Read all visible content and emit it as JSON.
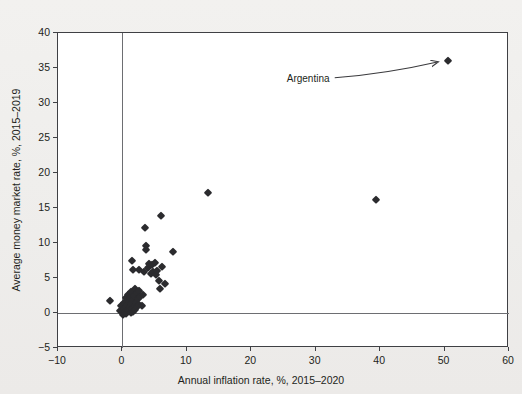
{
  "chart_data": {
    "type": "scatter",
    "title": "",
    "xlabel": "Annual inflation rate, %, 2015–2020",
    "ylabel": "Average money market rate, %, 2015–2019",
    "xlim": [
      -10,
      60
    ],
    "ylim": [
      -5,
      40
    ],
    "xticks": [
      -10,
      0,
      10,
      20,
      30,
      40,
      50,
      60
    ],
    "xtick_labels": [
      "−10",
      "0",
      "10",
      "20",
      "30",
      "40",
      "50",
      "60"
    ],
    "yticks": [
      -5,
      0,
      5,
      10,
      15,
      20,
      25,
      30,
      35,
      40
    ],
    "ytick_labels": [
      "−5",
      "0",
      "5",
      "10",
      "15",
      "20",
      "25",
      "30",
      "35",
      "40"
    ],
    "grid": false,
    "legend": null,
    "marker": "diamond",
    "marker_color": "#2b2b2e",
    "zero_lines": {
      "x": 0,
      "y": 0
    },
    "points": [
      [
        -1.9,
        1.7
      ],
      [
        -0.4,
        0.3
      ],
      [
        -0.2,
        1.0
      ],
      [
        0.0,
        0.2
      ],
      [
        0.1,
        -0.3
      ],
      [
        0.2,
        0.6
      ],
      [
        0.3,
        1.4
      ],
      [
        0.4,
        0.1
      ],
      [
        0.5,
        2.1
      ],
      [
        0.5,
        0.8
      ],
      [
        0.6,
        -0.2
      ],
      [
        0.7,
        1.1
      ],
      [
        0.8,
        0.4
      ],
      [
        0.9,
        2.6
      ],
      [
        1.0,
        1.6
      ],
      [
        1.0,
        0.3
      ],
      [
        1.1,
        0.9
      ],
      [
        1.2,
        2.2
      ],
      [
        1.3,
        0.0
      ],
      [
        1.3,
        1.3
      ],
      [
        1.4,
        3.0
      ],
      [
        1.5,
        0.6
      ],
      [
        1.6,
        1.9
      ],
      [
        1.7,
        0.2
      ],
      [
        1.8,
        2.4
      ],
      [
        1.9,
        1.0
      ],
      [
        2.0,
        3.4
      ],
      [
        2.0,
        0.5
      ],
      [
        2.1,
        1.5
      ],
      [
        2.2,
        2.8
      ],
      [
        2.3,
        0.8
      ],
      [
        2.4,
        2.0
      ],
      [
        2.5,
        1.2
      ],
      [
        2.6,
        3.2
      ],
      [
        2.8,
        2.3
      ],
      [
        3.0,
        1.0
      ],
      [
        3.2,
        2.6
      ],
      [
        1.5,
        7.5
      ],
      [
        1.6,
        6.2
      ],
      [
        2.6,
        6.1
      ],
      [
        3.4,
        5.8
      ],
      [
        3.5,
        12.2
      ],
      [
        3.6,
        9.6
      ],
      [
        3.7,
        9.0
      ],
      [
        4.0,
        6.5
      ],
      [
        4.2,
        7.0
      ],
      [
        4.4,
        5.6
      ],
      [
        4.6,
        6.8
      ],
      [
        4.8,
        5.9
      ],
      [
        5.0,
        7.2
      ],
      [
        5.2,
        5.4
      ],
      [
        5.4,
        6.0
      ],
      [
        5.6,
        4.6
      ],
      [
        5.8,
        3.4
      ],
      [
        6.0,
        13.8
      ],
      [
        6.2,
        6.6
      ],
      [
        6.6,
        4.1
      ],
      [
        7.8,
        8.7
      ],
      [
        13.3,
        17.1
      ],
      [
        39.4,
        16.1
      ],
      [
        50.6,
        36.0
      ]
    ],
    "annotations": [
      {
        "text": "Argentina",
        "point": [
          50.6,
          36.0
        ],
        "label_x": 25.5,
        "label_y": 33.6
      }
    ]
  }
}
